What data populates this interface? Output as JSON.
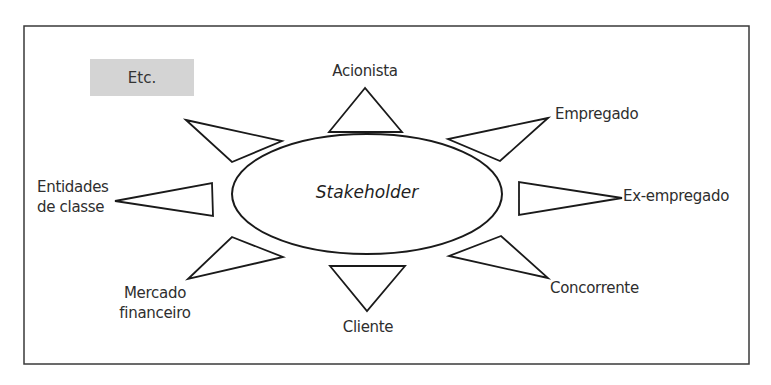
{
  "diagram": {
    "center": {
      "label": "Stakeholder"
    },
    "etc_box": {
      "label": "Etc.",
      "fill": "#d4d4d4"
    },
    "nodes": [
      {
        "id": "acionista",
        "label": "Acionista"
      },
      {
        "id": "empregado",
        "label": "Empregado"
      },
      {
        "id": "ex-empregado",
        "label": "Ex-empregado"
      },
      {
        "id": "concorrente",
        "label": "Concorrente"
      },
      {
        "id": "cliente",
        "label": "Cliente"
      },
      {
        "id": "mercado-financeiro",
        "label_line1": "Mercado",
        "label_line2": "financeiro"
      },
      {
        "id": "entidades-de-classe",
        "label_line1": "Entidades",
        "label_line2": "de classe"
      }
    ],
    "colors": {
      "stroke": "#1a1a1a",
      "frame": "#3a3a3a",
      "text": "#2e2e2e"
    }
  }
}
